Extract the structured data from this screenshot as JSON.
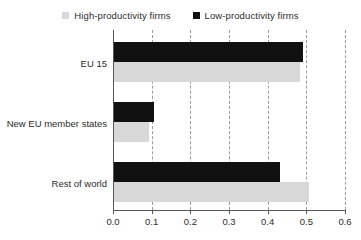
{
  "legend": {
    "position": "top-center",
    "entries": [
      {
        "label": "High-productivity firms",
        "color": "#d8d8d8",
        "swatch_name": "legend-swatch-high-productivity"
      },
      {
        "label": "Low-productivity firms",
        "color": "#111111",
        "swatch_name": "legend-swatch-low-productivity"
      }
    ]
  },
  "axis": {
    "x_ticks": [
      "0.0",
      "0.1",
      "0.2",
      "0.3",
      "0.4",
      "0.5",
      "0.6"
    ],
    "x_min": 0.0,
    "x_max": 0.6,
    "y_categories": [
      "EU 15",
      "New EU member states",
      "Rest of world"
    ]
  },
  "colors": {
    "high_productivity": "#d8d8d8",
    "low_productivity": "#111111",
    "grid": "#9a9a9a",
    "axis": "#575757",
    "text": "#2b2b2b",
    "background": "#ffffff"
  },
  "chart_data": {
    "type": "bar",
    "orientation": "horizontal",
    "title": "",
    "xlabel": "",
    "ylabel": "",
    "xlim": [
      0.0,
      0.6
    ],
    "grid": true,
    "legend_position": "top-center",
    "categories": [
      "EU 15",
      "New EU member states",
      "Rest of world"
    ],
    "series": [
      {
        "name": "Low-productivity firms",
        "color": "#111111",
        "values": [
          0.49,
          0.107,
          0.433
        ]
      },
      {
        "name": "High-productivity firms",
        "color": "#d8d8d8",
        "values": [
          0.483,
          0.093,
          0.508
        ]
      }
    ]
  }
}
